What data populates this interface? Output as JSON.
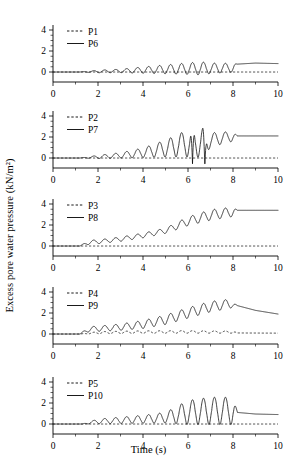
{
  "figure": {
    "xlabel": "Time (s)",
    "ylabel": "Excess pore water pressure (kN/m²)"
  },
  "chart_data": {
    "type": "line",
    "title": "",
    "xlabel": "Time (s)",
    "ylabel": "Excess pore water pressure (kN/m²)",
    "xlim": [
      0,
      10
    ],
    "ylim": [
      -1,
      4.6
    ],
    "xticks": [
      0,
      2,
      4,
      6,
      8,
      10
    ],
    "yticks": [
      0,
      2,
      4
    ],
    "xminor_step": 1,
    "yminor_step": 0.5,
    "grid": false,
    "legend_position": "top-left inside",
    "panels": [
      {
        "id": "panel-1",
        "legend": [
          "P1",
          "P6"
        ],
        "series": [
          {
            "name": "P1",
            "style": "dashed",
            "description": "flat, near zero through entire record",
            "envelope": {
              "baseline": [
                [
                  0,
                  0.0
                ],
                [
                  1.2,
                  0.0
                ],
                [
                  10,
                  0.0
                ]
              ],
              "amplitude": 0.0,
              "freq": 0.0
            },
            "final_value": 0.0
          },
          {
            "name": "P6",
            "style": "solid",
            "description": "quiet until t=1.2 s, then growing oscillation about a slowly rising mean, peak-to-peak ~1.2 near t=6-7 with downward spikes below zero, shaking ends t=8.2 then smooth level ~0.8",
            "envelope": {
              "baseline": [
                [
                  0,
                  0.0
                ],
                [
                  1.2,
                  0.0
                ],
                [
                  2,
                  0.05
                ],
                [
                  3,
                  0.1
                ],
                [
                  4,
                  0.18
                ],
                [
                  5,
                  0.25
                ],
                [
                  6,
                  0.32
                ],
                [
                  7,
                  0.35
                ],
                [
                  8,
                  0.4
                ],
                [
                  8.2,
                  0.75
                ],
                [
                  9,
                  0.85
                ],
                [
                  10,
                  0.8
                ]
              ],
              "amplitude_points": [
                [
                  1.2,
                  0.0
                ],
                [
                  2,
                  0.12
                ],
                [
                  3,
                  0.16
                ],
                [
                  4,
                  0.3
                ],
                [
                  5,
                  0.42
                ],
                [
                  6,
                  0.55
                ],
                [
                  6.6,
                  0.62
                ],
                [
                  7,
                  0.5
                ],
                [
                  8,
                  0.42
                ],
                [
                  8.2,
                  0.0
                ],
                [
                  10,
                  0.0
                ]
              ],
              "freq": 2.05
            },
            "final_value": 0.8
          }
        ]
      },
      {
        "id": "panel-2",
        "legend": [
          "P2",
          "P7"
        ],
        "series": [
          {
            "name": "P2",
            "style": "dashed",
            "description": "flat, near zero through entire record",
            "envelope": {
              "baseline": [
                [
                  0,
                  0.0
                ],
                [
                  10,
                  0.0
                ]
              ],
              "amplitude": 0.0,
              "freq": 0.0
            },
            "final_value": 0.0
          },
          {
            "name": "P7",
            "style": "solid",
            "description": "quiet until t=1.2 s, oscillation grows steadily, mean rises to ~2; large downward spikes reaching below zero near t=6.2 and t=6.8; after t=8.2 smooth plateau ~2.1",
            "envelope": {
              "baseline": [
                [
                  0,
                  0.0
                ],
                [
                  1.2,
                  0.0
                ],
                [
                  2,
                  0.1
                ],
                [
                  3,
                  0.25
                ],
                [
                  4,
                  0.5
                ],
                [
                  5,
                  0.9
                ],
                [
                  6,
                  1.4
                ],
                [
                  6.8,
                  1.6
                ],
                [
                  7.5,
                  1.9
                ],
                [
                  8.2,
                  2.1
                ],
                [
                  10,
                  2.1
                ]
              ],
              "amplitude_points": [
                [
                  1.2,
                  0.0
                ],
                [
                  2,
                  0.15
                ],
                [
                  3,
                  0.25
                ],
                [
                  4,
                  0.45
                ],
                [
                  5,
                  0.8
                ],
                [
                  6,
                  1.3
                ],
                [
                  6.6,
                  1.5
                ],
                [
                  7,
                  0.7
                ],
                [
                  8,
                  0.45
                ],
                [
                  8.2,
                  0.0
                ],
                [
                  10,
                  0.0
                ]
              ],
              "freq": 2.05,
              "spikes": [
                {
                  "t": 6.2,
                  "value": -0.55
                },
                {
                  "t": 6.75,
                  "value": -0.85
                }
              ]
            },
            "final_value": 2.1
          }
        ]
      },
      {
        "id": "panel-3",
        "legend": [
          "P3",
          "P8"
        ],
        "series": [
          {
            "name": "P3",
            "style": "dashed",
            "description": "flat, near zero through entire record",
            "envelope": {
              "baseline": [
                [
                  0,
                  0.0
                ],
                [
                  10,
                  0.0
                ]
              ],
              "amplitude": 0.0,
              "freq": 0.0
            },
            "final_value": 0.0
          },
          {
            "name": "P8",
            "style": "solid",
            "description": "rises from t=1.2 s with modest ripple on a strongly rising mean reaching ~3.3 by t=7, shaking stops t=8.2 leaving flat plateau ~3.4",
            "envelope": {
              "baseline": [
                [
                  0,
                  0.0
                ],
                [
                  1.2,
                  0.0
                ],
                [
                  1.6,
                  0.35
                ],
                [
                  2,
                  0.4
                ],
                [
                  3,
                  0.65
                ],
                [
                  4,
                  1.0
                ],
                [
                  5,
                  1.45
                ],
                [
                  6,
                  2.35
                ],
                [
                  7,
                  2.95
                ],
                [
                  8,
                  3.25
                ],
                [
                  8.2,
                  3.4
                ],
                [
                  10,
                  3.4
                ]
              ],
              "amplitude_points": [
                [
                  1.2,
                  0.0
                ],
                [
                  1.6,
                  0.2
                ],
                [
                  2,
                  0.18
                ],
                [
                  3,
                  0.2
                ],
                [
                  4,
                  0.22
                ],
                [
                  5,
                  0.25
                ],
                [
                  6,
                  0.42
                ],
                [
                  7,
                  0.5
                ],
                [
                  8,
                  0.45
                ],
                [
                  8.2,
                  0.0
                ],
                [
                  10,
                  0.0
                ]
              ],
              "freq": 2.05
            },
            "final_value": 3.4
          }
        ]
      },
      {
        "id": "panel-4",
        "legend": [
          "P4",
          "P9"
        ],
        "series": [
          {
            "name": "P4",
            "style": "dashed",
            "description": "small ripples about ~0.15-0.25 between t=1.5 and t=8, otherwise near zero",
            "envelope": {
              "baseline": [
                [
                  0,
                  0.0
                ],
                [
                  1.2,
                  0.0
                ],
                [
                  2,
                  0.12
                ],
                [
                  4,
                  0.18
                ],
                [
                  6,
                  0.2
                ],
                [
                  8,
                  0.18
                ],
                [
                  8.2,
                  0.1
                ],
                [
                  10,
                  0.08
                ]
              ],
              "amplitude_points": [
                [
                  1.2,
                  0.0
                ],
                [
                  2,
                  0.1
                ],
                [
                  4,
                  0.12
                ],
                [
                  6,
                  0.12
                ],
                [
                  8,
                  0.1
                ],
                [
                  8.2,
                  0.0
                ],
                [
                  10,
                  0.0
                ]
              ],
              "freq": 2.05
            },
            "final_value": 0.08
          },
          {
            "name": "P9",
            "style": "solid",
            "description": "oscillation grows from t=1.2 s on a rising mean peaking ~3.1 near t=7.5, shaking ends t=8.2 then decays smoothly to ~1.9 at t=10",
            "envelope": {
              "baseline": [
                [
                  0,
                  0.0
                ],
                [
                  1.2,
                  0.0
                ],
                [
                  1.6,
                  0.45
                ],
                [
                  2,
                  0.5
                ],
                [
                  3,
                  0.65
                ],
                [
                  4,
                  0.9
                ],
                [
                  5,
                  1.35
                ],
                [
                  6,
                  2.0
                ],
                [
                  7,
                  2.6
                ],
                [
                  7.8,
                  2.85
                ],
                [
                  8.2,
                  2.7
                ],
                [
                  9,
                  2.25
                ],
                [
                  10,
                  1.9
                ]
              ],
              "amplitude_points": [
                [
                  1.2,
                  0.0
                ],
                [
                  1.6,
                  0.25
                ],
                [
                  2,
                  0.25
                ],
                [
                  3,
                  0.3
                ],
                [
                  4,
                  0.38
                ],
                [
                  5,
                  0.45
                ],
                [
                  6,
                  0.5
                ],
                [
                  7,
                  0.5
                ],
                [
                  7.8,
                  0.45
                ],
                [
                  8.2,
                  0.0
                ],
                [
                  10,
                  0.0
                ]
              ],
              "freq": 2.05
            },
            "final_value": 1.9
          }
        ]
      },
      {
        "id": "panel-5",
        "legend": [
          "P5",
          "P10"
        ],
        "series": [
          {
            "name": "P5",
            "style": "dashed",
            "description": "flat, near zero through entire record",
            "envelope": {
              "baseline": [
                [
                  0,
                  0.0
                ],
                [
                  10,
                  0.0
                ]
              ],
              "amplitude": 0.0,
              "freq": 0.0
            },
            "final_value": 0.0
          },
          {
            "name": "P10",
            "style": "solid",
            "description": "oscillation from t=1.3 s growing to peaks ~2.6 between t=6 and t=8 with troughs near zero; sharp drop at t=8.2 to ~1.1 then slow decay to ~0.9",
            "envelope": {
              "baseline": [
                [
                  0,
                  0.0
                ],
                [
                  1.3,
                  0.0
                ],
                [
                  2,
                  0.25
                ],
                [
                  3,
                  0.35
                ],
                [
                  4,
                  0.45
                ],
                [
                  5,
                  0.6
                ],
                [
                  6,
                  1.1
                ],
                [
                  7,
                  1.25
                ],
                [
                  8,
                  1.25
                ],
                [
                  8.2,
                  1.1
                ],
                [
                  9,
                  0.95
                ],
                [
                  10,
                  0.9
                ]
              ],
              "amplitude_points": [
                [
                  1.3,
                  0.0
                ],
                [
                  2,
                  0.22
                ],
                [
                  3,
                  0.3
                ],
                [
                  4,
                  0.38
                ],
                [
                  5,
                  0.5
                ],
                [
                  6,
                  1.15
                ],
                [
                  7,
                  1.3
                ],
                [
                  8,
                  1.3
                ],
                [
                  8.2,
                  0.0
                ],
                [
                  10,
                  0.0
                ]
              ],
              "freq": 2.05
            },
            "final_value": 0.9
          }
        ]
      }
    ]
  }
}
